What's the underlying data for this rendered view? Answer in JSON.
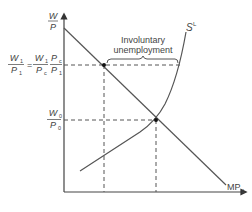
{
  "diagram": {
    "type": "labour-market",
    "axes": {
      "y_label_num": "W",
      "y_label_den": "P",
      "x_label": ""
    },
    "curves": {
      "demand_label": "MP",
      "demand_sub": "L",
      "supply_label": "S",
      "supply_sup": "L"
    },
    "levels": {
      "upper_lhs_num": "W",
      "upper_lhs_num_sub": "1",
      "upper_lhs_den": "P",
      "upper_lhs_den_sub": "1",
      "equals": "=",
      "upper_mid_num": "W",
      "upper_mid_num_sub": "1",
      "upper_mid_den": "P",
      "upper_mid_den_sub": "c",
      "upper_rhs_num": "P",
      "upper_rhs_num_sub": "c",
      "upper_rhs_den": "P",
      "upper_rhs_den_sub": "1",
      "lower_num": "W",
      "lower_num_sub": "0",
      "lower_den": "P",
      "lower_den_sub": "0"
    },
    "annotation": {
      "line1": "Involuntary",
      "line2": "unemployment"
    },
    "colors": {
      "line": "#555555",
      "text": "#444444",
      "point": "#111111"
    }
  }
}
